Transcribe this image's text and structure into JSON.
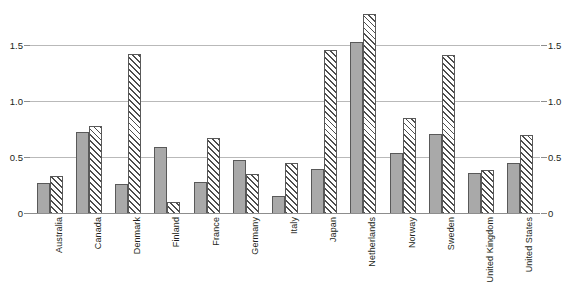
{
  "chart_data": {
    "type": "bar",
    "title": "",
    "subtitle": "",
    "xlabel": "",
    "ylabel": "",
    "ylim": [
      0,
      1.85
    ],
    "yticks": [
      0,
      0.5,
      1.0,
      1.5
    ],
    "ytick_labels": [
      "0",
      "0.5",
      "1.0",
      "1.5"
    ],
    "ytick_labels_right": [
      "0",
      "0.5",
      "1.0",
      "1.5"
    ],
    "grid": true,
    "grid_axis": "y",
    "legend": null,
    "legend_position": "none",
    "dual_axis": true,
    "categories": [
      "Australia",
      "Canada",
      "Denmark",
      "Finland",
      "France",
      "Germany",
      "Italy",
      "Japan",
      "Netherlands",
      "Norway",
      "Sweden",
      "United Kingdom",
      "United States"
    ],
    "series": [
      {
        "name": "series-1",
        "style": "solid-gray",
        "color": "#a9a9a9",
        "values": [
          0.27,
          0.72,
          0.26,
          0.59,
          0.28,
          0.47,
          0.15,
          0.39,
          1.53,
          0.54,
          0.71,
          0.36,
          0.45
        ]
      },
      {
        "name": "series-2",
        "style": "diagonal-hatch",
        "color": "#ffffff",
        "values": [
          0.33,
          0.78,
          1.42,
          0.1,
          0.67,
          0.35,
          0.45,
          1.46,
          1.78,
          0.85,
          1.41,
          0.38,
          0.7
        ]
      }
    ]
  },
  "colors": {
    "background": "#ffffff",
    "gridline": "#b9b9b9",
    "axis": "#8d8d8d",
    "bar_solid": "#a9a9a9",
    "bar_border": "#595959",
    "hatch_stroke": "#4d4d4d",
    "text": "#231f20"
  }
}
